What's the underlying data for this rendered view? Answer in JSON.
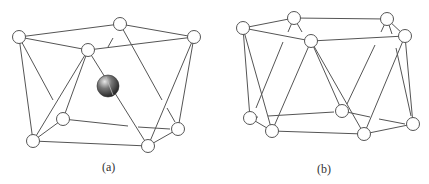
{
  "figure": {
    "panels": [
      {
        "id": "a",
        "label": "(a)",
        "label_pos": [
          110,
          168
        ],
        "nodes": [
          {
            "id": "A",
            "x": 19,
            "y": 37
          },
          {
            "id": "B",
            "x": 120,
            "y": 24
          },
          {
            "id": "C",
            "x": 194,
            "y": 37
          },
          {
            "id": "D",
            "x": 88,
            "y": 50
          },
          {
            "id": "E",
            "x": 63,
            "y": 119
          },
          {
            "id": "F",
            "x": 33,
            "y": 141
          },
          {
            "id": "G",
            "x": 148,
            "y": 146
          },
          {
            "id": "H",
            "x": 178,
            "y": 129
          }
        ],
        "edges": [
          [
            "A",
            "B"
          ],
          [
            "B",
            "C"
          ],
          [
            "A",
            "D"
          ],
          [
            "D",
            "C"
          ],
          [
            "A",
            "F"
          ],
          [
            "D",
            "F"
          ],
          [
            "D",
            "E"
          ],
          [
            "D",
            "G"
          ],
          [
            "C",
            "G"
          ],
          [
            "C",
            "H"
          ],
          [
            "F",
            "E"
          ],
          [
            "F",
            "G"
          ],
          [
            "G",
            "H"
          ]
        ],
        "hidden_edges": [
          {
            "from": "A",
            "to": "E",
            "segments": [
              [
                19,
                37,
                53,
                100
              ]
            ]
          },
          {
            "from": "B",
            "to": "E",
            "segments": [
              [
                113,
                38,
                108,
                47
              ]
            ]
          },
          {
            "from": "B",
            "to": "H",
            "segments": [
              [
                120,
                24,
                162,
                100
              ],
              [
                167,
                108,
                175,
                122
              ]
            ]
          },
          {
            "from": "E",
            "to": "H",
            "segments": [
              [
                63,
                119,
                128,
                126
              ],
              [
                138,
                127,
                170,
                129
              ]
            ]
          }
        ],
        "central_atom": {
          "x": 108,
          "y": 86,
          "r": 11,
          "color": "#555555"
        }
      },
      {
        "id": "b",
        "label": "(b)",
        "label_pos": [
          325,
          170
        ],
        "nodes": [
          {
            "id": "P1",
            "x": 243,
            "y": 28
          },
          {
            "id": "P2",
            "x": 294,
            "y": 18
          },
          {
            "id": "P3",
            "x": 311,
            "y": 41
          },
          {
            "id": "P4",
            "x": 387,
            "y": 19
          },
          {
            "id": "P5",
            "x": 405,
            "y": 36
          },
          {
            "id": "P6",
            "x": 250,
            "y": 118
          },
          {
            "id": "P7",
            "x": 272,
            "y": 131
          },
          {
            "id": "P8",
            "x": 342,
            "y": 111
          },
          {
            "id": "P9",
            "x": 364,
            "y": 134
          },
          {
            "id": "P10",
            "x": 413,
            "y": 124
          }
        ],
        "edges": [
          [
            "P1",
            "P2"
          ],
          [
            "P1",
            "P3"
          ],
          [
            "P2",
            "P4"
          ],
          [
            "P3",
            "P5"
          ],
          [
            "P4",
            "P5"
          ],
          [
            "P1",
            "P6"
          ],
          [
            "P1",
            "P7"
          ],
          [
            "P3",
            "P7"
          ],
          [
            "P3",
            "P9"
          ],
          [
            "P3",
            "P8"
          ],
          [
            "P5",
            "P9"
          ],
          [
            "P5",
            "P10"
          ],
          [
            "P6",
            "P7"
          ],
          [
            "P7",
            "P9"
          ],
          [
            "P9",
            "P10"
          ]
        ],
        "hidden_edges": [
          {
            "from": "P2",
            "to": "P6",
            "segments": [
              [
                294,
                18,
                288,
                32
              ],
              [
                283,
                42,
                256,
                108
              ]
            ]
          },
          {
            "from": "P2",
            "to": "P3",
            "segments": [
              [
                294,
                18,
                302,
                32
              ]
            ]
          },
          {
            "from": "P4",
            "to": "P8",
            "segments": [
              [
                387,
                19,
                381,
                32
              ],
              [
                375,
                45,
                347,
                104
              ]
            ]
          },
          {
            "from": "P4",
            "to": "P10",
            "segments": [
              [
                387,
                19,
                392,
                34
              ],
              [
                396,
                48,
                411,
                116
              ]
            ]
          },
          {
            "from": "P6",
            "to": "P8",
            "segments": [
              [
                250,
                118,
                258,
                117
              ],
              [
                268,
                116,
                334,
                112
              ]
            ]
          },
          {
            "from": "P8",
            "to": "P10",
            "segments": [
              [
                342,
                111,
                370,
                117
              ],
              [
                379,
                119,
                405,
                124
              ]
            ]
          }
        ]
      }
    ],
    "colors": {
      "line": "#555555",
      "node_fill": "#ffffff",
      "atom": "#555555"
    }
  }
}
